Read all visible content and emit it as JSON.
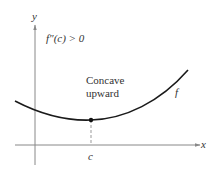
{
  "figure": {
    "y_axis_label": "y",
    "x_axis_label": "x",
    "condition": "f″(c) > 0",
    "annotation_line1": "Concave",
    "annotation_line2": "upward",
    "curve_label": "f",
    "point_label": "c"
  },
  "colors": {
    "axis": "#888888",
    "curve": "#1a1a1a",
    "text": "#333333"
  }
}
